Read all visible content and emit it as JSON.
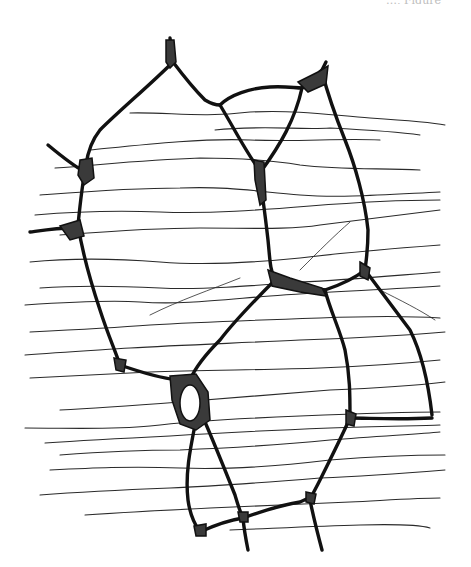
{
  "page": {
    "header_fragment": "…, Figure",
    "figure": {
      "name": "plant-tissue-cell-wall-engraving",
      "description": "Engraved illustration of irregular polygonal cells with thick dark walls, stippled intercellular junctions, and fine horizontal fibrous striations crossing the tissue",
      "colors": {
        "ink": "#111111",
        "background": "#ffffff",
        "stipple": "#3a3a3a"
      }
    }
  }
}
